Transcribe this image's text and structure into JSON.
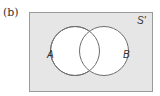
{
  "figure": {
    "part_label": "(b)",
    "universal_set_label": "S'",
    "sets": [
      {
        "label": "A"
      },
      {
        "label": "B"
      }
    ],
    "colors": {
      "universe_fill": "#e6e6e6",
      "universe_border": "#9a9a9a",
      "circle_fill": "#ffffff",
      "circle_stroke": "#6e6e6e"
    }
  }
}
